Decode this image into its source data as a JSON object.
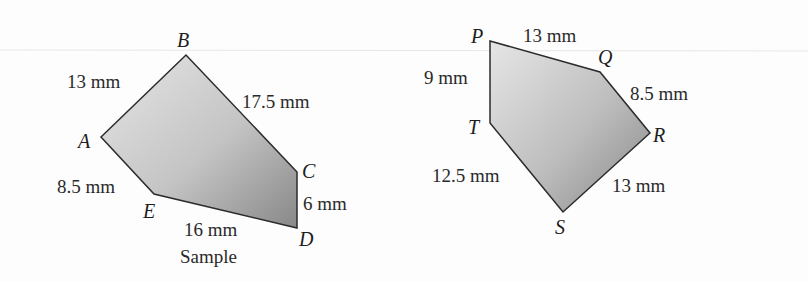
{
  "figures": [
    {
      "name": "Sample",
      "caption": "Sample",
      "vertices": [
        {
          "label": "A",
          "x": 101,
          "y": 137
        },
        {
          "label": "B",
          "x": 186,
          "y": 55
        },
        {
          "label": "C",
          "x": 297,
          "y": 172
        },
        {
          "label": "D",
          "x": 297,
          "y": 228
        },
        {
          "label": "E",
          "x": 154,
          "y": 194
        }
      ],
      "sides": [
        {
          "edge": "AB",
          "length": "13 mm"
        },
        {
          "edge": "BC",
          "length": "17.5 mm"
        },
        {
          "edge": "CD",
          "length": "6 mm"
        },
        {
          "edge": "DE",
          "length": "16 mm"
        },
        {
          "edge": "EA",
          "length": "8.5 mm"
        }
      ]
    },
    {
      "name": "PQRST",
      "vertices": [
        {
          "label": "P",
          "x": 490,
          "y": 41
        },
        {
          "label": "Q",
          "x": 600,
          "y": 72
        },
        {
          "label": "R",
          "x": 650,
          "y": 133
        },
        {
          "label": "S",
          "x": 563,
          "y": 212
        },
        {
          "label": "T",
          "x": 490,
          "y": 123
        }
      ],
      "sides": [
        {
          "edge": "PQ",
          "length": "13 mm"
        },
        {
          "edge": "QR",
          "length": "8.5 mm"
        },
        {
          "edge": "RS",
          "length": "13 mm"
        },
        {
          "edge": "ST",
          "length": "12.5 mm"
        },
        {
          "edge": "TP",
          "length": "9 mm"
        }
      ]
    }
  ],
  "colors": {
    "fill_light": "#e4e4e4",
    "fill_dark": "#8a8a8a",
    "stroke": "#2b2b2b"
  }
}
